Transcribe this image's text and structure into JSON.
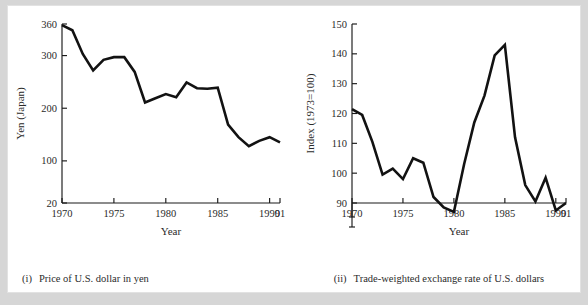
{
  "figure": {
    "background_color": "#d6d6d6",
    "page_color": "#ffffff",
    "ink_color": "#121212"
  },
  "panels": {
    "left": {
      "caption_number": "(i)",
      "caption_text": "Price of U.S. dollar in yen"
    },
    "right": {
      "caption_number": "(ii)",
      "caption_text": "Trade-weighted exchange rate of U.S. dollars"
    }
  },
  "chart_data": [
    {
      "type": "line",
      "title": "",
      "panel": "i",
      "caption": "(i)  Price of U.S. dollar in yen",
      "xlabel": "Year",
      "ylabel": "Yen (Japan)",
      "grid": false,
      "legend": "none",
      "xlim": [
        1970,
        1991
      ],
      "ylim": [
        20,
        360
      ],
      "xticks": [
        1970,
        1975,
        1980,
        1985,
        1990,
        1991
      ],
      "xtick_labels": [
        "1970",
        "1975",
        "1980",
        "1985",
        "1990",
        "91"
      ],
      "yticks": [
        20,
        100,
        200,
        300,
        360
      ],
      "ytick_labels": [
        "20",
        "100",
        "200",
        "300",
        "360"
      ],
      "y_axis_break": false,
      "x": [
        1970,
        1971,
        1972,
        1973,
        1974,
        1975,
        1976,
        1977,
        1978,
        1979,
        1980,
        1981,
        1982,
        1983,
        1984,
        1985,
        1986,
        1987,
        1988,
        1989,
        1990,
        1991
      ],
      "values": [
        358,
        348,
        303,
        272,
        292,
        297,
        297,
        269,
        211,
        219,
        227,
        221,
        249,
        238,
        237,
        239,
        169,
        145,
        128,
        138,
        145,
        135
      ],
      "series_name": "Yen per U.S. dollar"
    },
    {
      "type": "line",
      "title": "",
      "panel": "ii",
      "caption": "(ii)  Trade-weighted exchange rate of U.S. dollars",
      "xlabel": "Year",
      "ylabel": "Index (1973=100)",
      "grid": false,
      "legend": "none",
      "xlim": [
        1970,
        1991
      ],
      "ylim": [
        90,
        150
      ],
      "xticks": [
        1970,
        1975,
        1980,
        1985,
        1990,
        1991
      ],
      "xtick_labels": [
        "1970",
        "1975",
        "1980",
        "1985",
        "1990",
        "91"
      ],
      "yticks": [
        90,
        100,
        110,
        120,
        130,
        140,
        150
      ],
      "ytick_labels": [
        "90",
        "100",
        "110",
        "120",
        "130",
        "140",
        "150"
      ],
      "y_axis_break": true,
      "x": [
        1970,
        1971,
        1972,
        1973,
        1974,
        1975,
        1976,
        1977,
        1978,
        1979,
        1980,
        1981,
        1982,
        1983,
        1984,
        1985,
        1986,
        1987,
        1988,
        1989,
        1990,
        1991
      ],
      "values": [
        121.5,
        119.5,
        110.5,
        99.5,
        101.5,
        98,
        105,
        103.5,
        92,
        88.5,
        87,
        103,
        117,
        126,
        139.5,
        143,
        112,
        96,
        90.5,
        98.5,
        87.5,
        90
      ],
      "series_name": "Trade-weighted index"
    }
  ]
}
